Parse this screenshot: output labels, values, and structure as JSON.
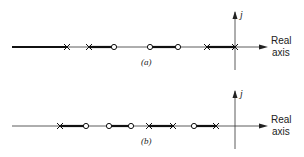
{
  "diagrams": [
    {
      "id": "a",
      "caption": "(a)",
      "axis_y": 47,
      "imag_axis_label": "j",
      "real_axis_label_line1": "Real",
      "real_axis_label_line2": "axis",
      "segments": [
        {
          "x1": 12,
          "x2": 67,
          "thick": true
        },
        {
          "x1": 67,
          "x2": 89,
          "thick": false
        },
        {
          "x1": 89,
          "x2": 114,
          "thick": true
        },
        {
          "x1": 114,
          "x2": 150,
          "thick": false
        },
        {
          "x1": 150,
          "x2": 178,
          "thick": true
        },
        {
          "x1": 178,
          "x2": 207,
          "thick": false
        },
        {
          "x1": 207,
          "x2": 235,
          "thick": true
        }
      ],
      "poles": [
        67,
        89,
        207,
        235
      ],
      "zeros": [
        114,
        150,
        178
      ]
    },
    {
      "id": "b",
      "caption": "(b)",
      "axis_y": 126,
      "imag_axis_label": "j",
      "real_axis_label_line1": "Real",
      "real_axis_label_line2": "axis",
      "segments": [
        {
          "x1": 12,
          "x2": 60,
          "thick": false
        },
        {
          "x1": 60,
          "x2": 86,
          "thick": true
        },
        {
          "x1": 86,
          "x2": 109,
          "thick": false
        },
        {
          "x1": 109,
          "x2": 131,
          "thick": true
        },
        {
          "x1": 131,
          "x2": 149,
          "thick": false
        },
        {
          "x1": 149,
          "x2": 173,
          "thick": true
        },
        {
          "x1": 173,
          "x2": 194,
          "thick": false
        },
        {
          "x1": 194,
          "x2": 216,
          "thick": true
        }
      ],
      "poles": [
        60,
        149,
        173,
        216
      ],
      "zeros": [
        86,
        109,
        131,
        194
      ]
    }
  ]
}
